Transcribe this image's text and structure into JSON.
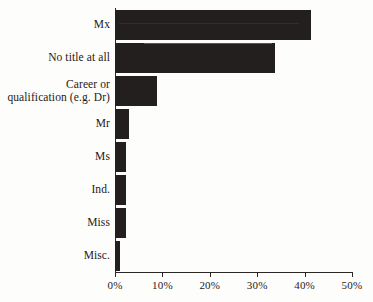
{
  "chart_data": {
    "type": "bar",
    "orientation": "horizontal",
    "title": "",
    "subtitle": "",
    "xlabel": "",
    "ylabel": "",
    "categories": [
      "Mx",
      "No title at all",
      "Career or\nqualification (e.g. Dr)",
      "Mr",
      "Ms",
      "Ind.",
      "Miss",
      "Misc."
    ],
    "values": [
      41.3,
      33.8,
      8.9,
      2.9,
      2.3,
      2.3,
      2.3,
      1.0
    ],
    "value_unit": "%",
    "xlim": [
      0,
      50
    ],
    "xticks": [
      0,
      10,
      20,
      30,
      40,
      50
    ],
    "xtick_labels": [
      "0%",
      "10%",
      "20%",
      "30%",
      "40%",
      "50%"
    ],
    "grid": false,
    "legend": false,
    "legend_position": "none",
    "bar_color": "#231f1e",
    "axis_color": "#2b2724",
    "text_color": "#1d1a18",
    "background_color": "#fdfdfb"
  },
  "caption": {
    "text": ""
  }
}
